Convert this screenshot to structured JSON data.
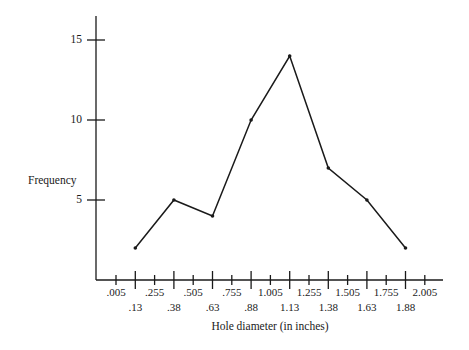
{
  "chart_data": {
    "type": "line",
    "title": "",
    "xlabel": "Hole diameter (in inches)",
    "ylabel": "Frequency",
    "x": [
      0.13,
      0.38,
      0.63,
      0.88,
      1.13,
      1.38,
      1.63,
      1.88
    ],
    "x_labels": [
      ".13",
      ".38",
      ".63",
      ".88",
      "1.13",
      "1.38",
      "1.63",
      "1.88"
    ],
    "values": [
      2,
      5,
      4,
      10,
      14,
      7,
      5,
      2
    ],
    "series": [
      {
        "name": "Frequency polygon",
        "values": [
          2,
          5,
          4,
          10,
          14,
          7,
          5,
          2
        ]
      }
    ],
    "class_boundaries": [
      ".005",
      ".255",
      ".505",
      ".755",
      "1.005",
      "1.255",
      "1.505",
      "1.755",
      "2.005"
    ],
    "y_ticks": [
      "5",
      "10",
      "15"
    ],
    "ylim": [
      0,
      16.5
    ],
    "xlim": [
      -0.12,
      2.12
    ],
    "grid": false,
    "legend": null,
    "colors": {
      "line": "#1a1a1a",
      "axis": "#1a1a1a"
    }
  },
  "axes": {
    "xlabel": "Hole diameter (in inches)",
    "ylabel": "Frequency"
  }
}
